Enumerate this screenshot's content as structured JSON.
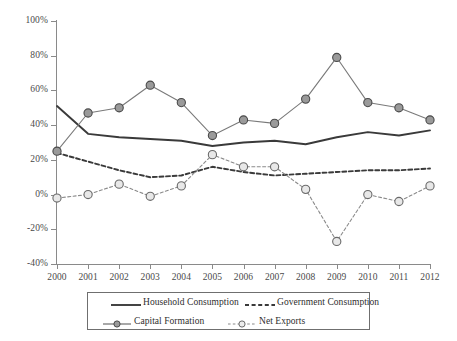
{
  "chart_data": {
    "type": "line",
    "title": "",
    "subtitle": "",
    "xlabel": "",
    "ylabel": "",
    "categories": [
      "2000",
      "2001",
      "2002",
      "2003",
      "2004",
      "2005",
      "2006",
      "2007",
      "2008",
      "2009",
      "2010",
      "2011",
      "2012"
    ],
    "x": [
      2000,
      2001,
      2002,
      2003,
      2004,
      2005,
      2006,
      2007,
      2008,
      2009,
      2010,
      2011,
      2012
    ],
    "ylim": [
      -40,
      100
    ],
    "yticks": [
      100,
      80,
      60,
      40,
      20,
      0,
      -20,
      -40
    ],
    "ytick_labels": [
      "100%",
      "80%",
      "60%",
      "40%",
      "20%",
      "0%",
      "-20%",
      "-40%"
    ],
    "xtick_labels": [
      "2000",
      "2001",
      "2002",
      "2003",
      "2004",
      "2005",
      "2006",
      "2007",
      "2008",
      "2009",
      "2010",
      "2011",
      "2012"
    ],
    "grid": false,
    "legend_position": "bottom",
    "units": "percent of GDP",
    "series": [
      {
        "name": "Household Consumption",
        "style": "solid",
        "marker": "none",
        "color": "#3a3a3a",
        "values": [
          51,
          35,
          33,
          32,
          31,
          28,
          30,
          31,
          29,
          33,
          36,
          34,
          37
        ]
      },
      {
        "name": "Government Consumption",
        "style": "dashed",
        "marker": "none",
        "color": "#3a3a3a",
        "values": [
          24,
          19,
          14,
          10,
          11,
          16,
          13,
          11,
          12,
          13,
          14,
          14,
          15
        ]
      },
      {
        "name": "Capital Formation",
        "style": "solid",
        "marker": "filled-circle",
        "color": "#8f8f8f",
        "values": [
          25,
          47,
          50,
          63,
          53,
          34,
          43,
          41,
          55,
          79,
          53,
          50,
          43
        ]
      },
      {
        "name": "Net Exports",
        "style": "dashed",
        "marker": "open-circle",
        "color": "#8f8f8f",
        "values": [
          -2,
          0,
          6,
          -1,
          5,
          23,
          16,
          16,
          3,
          -27,
          0,
          -4,
          5
        ]
      }
    ]
  },
  "legend": {
    "items": [
      {
        "label": "Household Consumption",
        "swatch": "solid-line-swatch"
      },
      {
        "label": "Government Consumption",
        "swatch": "dashed-line-swatch"
      },
      {
        "label": "Capital Formation",
        "swatch": "solid-line-filled-marker-swatch"
      },
      {
        "label": "Net Exports",
        "swatch": "dashed-line-open-marker-swatch"
      }
    ]
  },
  "colors": {
    "axis": "#8a8a8a",
    "dark_series": "#3a3a3a",
    "gray_series": "#8f8f8f",
    "marker_fill": "#9a9a9a",
    "marker_open_fill": "#e8e8e8",
    "text": "#4a4a4a",
    "background": "#ffffff"
  }
}
